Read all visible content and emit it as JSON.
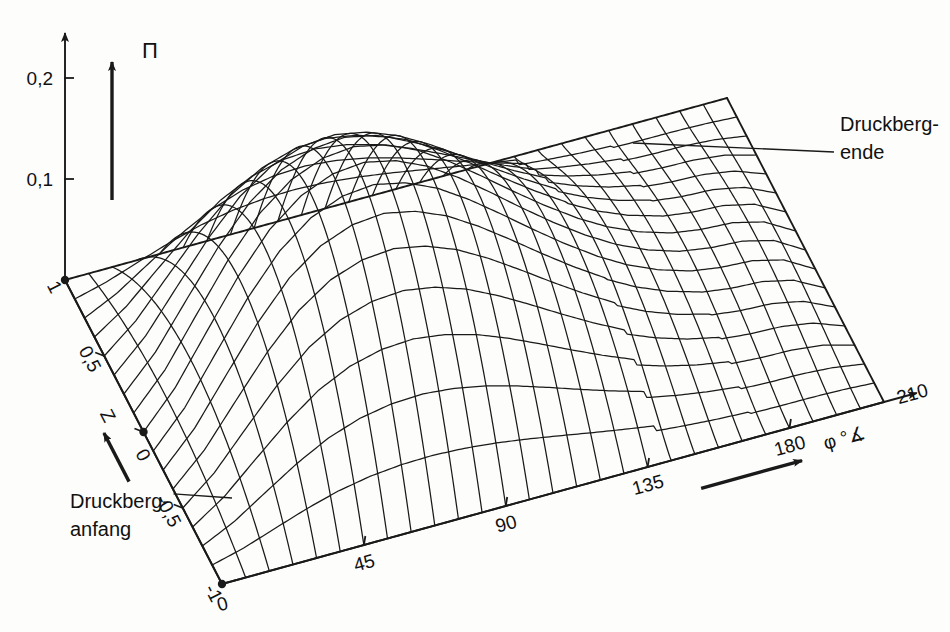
{
  "figure": {
    "kind": "wireframe-surface-3d",
    "background_color": "#fdfdfb",
    "line_color": "#1a1a1a",
    "text_color": "#111111"
  },
  "axes": {
    "vertical": {
      "name": "Pi",
      "label": "Π",
      "ticks": [
        {
          "value": 0.2,
          "label": "0,2"
        },
        {
          "value": 0.1,
          "label": "0,1"
        }
      ],
      "min": 0.0,
      "max": 0.215
    },
    "depth": {
      "name": "Z",
      "label": "Z",
      "ticks": [
        {
          "value": 1,
          "label": "1"
        },
        {
          "value": 0.5,
          "label": "0,5"
        },
        {
          "value": 0,
          "label": "0"
        },
        {
          "value": -0.5,
          "label": "-0,5"
        },
        {
          "value": -1,
          "label": "-1"
        }
      ],
      "min": -1,
      "max": 1
    },
    "horizontal": {
      "name": "phi",
      "label": "φ °∡",
      "ticks": [
        {
          "value": 0,
          "label": "0"
        },
        {
          "value": 45,
          "label": "45"
        },
        {
          "value": 90,
          "label": "90"
        },
        {
          "value": 135,
          "label": "135"
        },
        {
          "value": 180,
          "label": "180"
        },
        {
          "value": 210,
          "label": "210"
        }
      ],
      "min": 0,
      "max": 210
    }
  },
  "annotations": [
    {
      "id": "druckberg-anfang",
      "line1": "Druckberg-",
      "line2": "anfang"
    },
    {
      "id": "druckberg-ende",
      "line1": "Druckberg-",
      "line2": "ende"
    }
  ],
  "chart_data": {
    "type": "surface",
    "title": "",
    "xlabel": "φ °∡",
    "ylabel": "Z",
    "zlabel": "Π",
    "xlim": [
      0,
      210
    ],
    "ylim": [
      -1,
      1
    ],
    "zlim": [
      0,
      0.215
    ],
    "grid": true,
    "legend": "none",
    "x": [
      0,
      10,
      20,
      30,
      40,
      50,
      60,
      70,
      80,
      90,
      100,
      110,
      120,
      130,
      140,
      150,
      160,
      170,
      180,
      190,
      200,
      210
    ],
    "y": [
      -1,
      -0.8,
      -0.6,
      -0.4,
      -0.2,
      0,
      0.2,
      0.4,
      0.6,
      0.8,
      1
    ],
    "z_center_profile": [
      0.0,
      0.035,
      0.082,
      0.128,
      0.166,
      0.191,
      0.204,
      0.207,
      0.2,
      0.186,
      0.166,
      0.143,
      0.119,
      0.096,
      0.075,
      0.057,
      0.043,
      0.033,
      0.028,
      0.026,
      0.018,
      0.0
    ],
    "z_edge_profile": [
      0.0,
      0.0,
      0.0,
      0.0,
      0.0,
      0.0,
      0.0,
      0.0,
      0.0,
      0.0,
      0.0,
      0.0,
      0.0,
      0.0,
      0.0,
      0.0,
      0.0,
      0.0,
      0.0,
      0.0,
      0.0,
      0.0
    ]
  },
  "projection": {
    "origin_px": [
      222,
      584
    ],
    "phi_axis_end_px": [
      884,
      402
    ],
    "z_axis_top_px": [
      65,
      280
    ],
    "pi_unit_px_per_0_1": 101
  }
}
